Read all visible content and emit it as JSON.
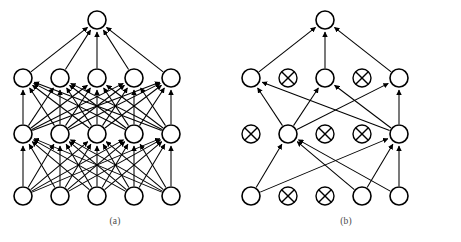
{
  "figure": {
    "background_color": "#ffffff",
    "stroke_color": "#000000",
    "width": 461,
    "height": 242
  },
  "panels": [
    {
      "id": "a",
      "caption": "(a)",
      "description": "Fully connected feed-forward neural network",
      "node_radius": 9,
      "columns_x": [
        23,
        60,
        97,
        134,
        171
      ],
      "layers": [
        {
          "name": "output-layer",
          "y": 20,
          "nodes": [
            {
              "col": 2,
              "state": "active"
            }
          ]
        },
        {
          "name": "hidden-layer-2",
          "y": 78,
          "nodes": [
            {
              "col": 0,
              "state": "active"
            },
            {
              "col": 1,
              "state": "active"
            },
            {
              "col": 2,
              "state": "active"
            },
            {
              "col": 3,
              "state": "active"
            },
            {
              "col": 4,
              "state": "active"
            }
          ]
        },
        {
          "name": "hidden-layer-1",
          "y": 134,
          "nodes": [
            {
              "col": 0,
              "state": "active"
            },
            {
              "col": 1,
              "state": "active"
            },
            {
              "col": 2,
              "state": "active"
            },
            {
              "col": 3,
              "state": "active"
            },
            {
              "col": 4,
              "state": "active"
            }
          ]
        },
        {
          "name": "input-layer",
          "y": 196,
          "nodes": [
            {
              "col": 0,
              "state": "active"
            },
            {
              "col": 1,
              "state": "active"
            },
            {
              "col": 2,
              "state": "active"
            },
            {
              "col": 3,
              "state": "active"
            },
            {
              "col": 4,
              "state": "active"
            }
          ]
        }
      ],
      "connectivity": "fully-connected",
      "edge_count": 55
    },
    {
      "id": "b",
      "caption": "(b)",
      "description": "Pruned sparse neural network with removed units marked by crossed circles",
      "node_radius": 9,
      "columns_x": [
        20,
        57,
        94,
        131,
        168
      ],
      "layers": [
        {
          "name": "output-layer",
          "y": 20,
          "nodes": [
            {
              "col": 2,
              "state": "active"
            }
          ]
        },
        {
          "name": "hidden-layer-2",
          "y": 78,
          "nodes": [
            {
              "col": 0,
              "state": "active"
            },
            {
              "col": 1,
              "state": "pruned"
            },
            {
              "col": 2,
              "state": "active"
            },
            {
              "col": 3,
              "state": "pruned"
            },
            {
              "col": 4,
              "state": "active"
            }
          ]
        },
        {
          "name": "hidden-layer-1",
          "y": 134,
          "nodes": [
            {
              "col": 0,
              "state": "pruned"
            },
            {
              "col": 1,
              "state": "active"
            },
            {
              "col": 2,
              "state": "pruned"
            },
            {
              "col": 3,
              "state": "pruned"
            },
            {
              "col": 4,
              "state": "active"
            }
          ]
        },
        {
          "name": "input-layer",
          "y": 196,
          "nodes": [
            {
              "col": 0,
              "state": "active"
            },
            {
              "col": 1,
              "state": "pruned"
            },
            {
              "col": 2,
              "state": "pruned"
            },
            {
              "col": 3,
              "state": "active"
            },
            {
              "col": 4,
              "state": "active"
            }
          ]
        }
      ],
      "connectivity": "sparse-pruned",
      "edges": [
        {
          "from_layer": "hidden-layer-2",
          "from_col": 0,
          "to_layer": "output-layer",
          "to_col": 2
        },
        {
          "from_layer": "hidden-layer-2",
          "from_col": 2,
          "to_layer": "output-layer",
          "to_col": 2
        },
        {
          "from_layer": "hidden-layer-2",
          "from_col": 4,
          "to_layer": "output-layer",
          "to_col": 2
        },
        {
          "from_layer": "hidden-layer-1",
          "from_col": 1,
          "to_layer": "hidden-layer-2",
          "to_col": 0
        },
        {
          "from_layer": "hidden-layer-1",
          "from_col": 1,
          "to_layer": "hidden-layer-2",
          "to_col": 2
        },
        {
          "from_layer": "hidden-layer-1",
          "from_col": 1,
          "to_layer": "hidden-layer-2",
          "to_col": 4
        },
        {
          "from_layer": "hidden-layer-1",
          "from_col": 4,
          "to_layer": "hidden-layer-2",
          "to_col": 0
        },
        {
          "from_layer": "hidden-layer-1",
          "from_col": 4,
          "to_layer": "hidden-layer-2",
          "to_col": 2
        },
        {
          "from_layer": "hidden-layer-1",
          "from_col": 4,
          "to_layer": "hidden-layer-2",
          "to_col": 4
        },
        {
          "from_layer": "input-layer",
          "from_col": 0,
          "to_layer": "hidden-layer-1",
          "to_col": 1
        },
        {
          "from_layer": "input-layer",
          "from_col": 0,
          "to_layer": "hidden-layer-1",
          "to_col": 4
        },
        {
          "from_layer": "input-layer",
          "from_col": 3,
          "to_layer": "hidden-layer-1",
          "to_col": 1
        },
        {
          "from_layer": "input-layer",
          "from_col": 3,
          "to_layer": "hidden-layer-1",
          "to_col": 4
        },
        {
          "from_layer": "input-layer",
          "from_col": 4,
          "to_layer": "hidden-layer-1",
          "to_col": 1
        },
        {
          "from_layer": "input-layer",
          "from_col": 4,
          "to_layer": "hidden-layer-1",
          "to_col": 4
        }
      ],
      "edge_count": 15
    }
  ]
}
